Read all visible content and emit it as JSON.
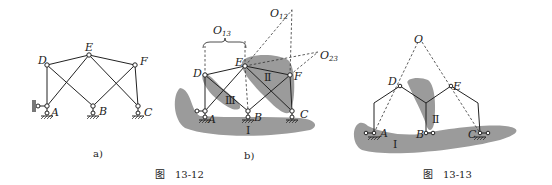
{
  "figure_13_12": {
    "caption": "图　13-12",
    "subfig_a": {
      "label": "a)",
      "joints": {
        "A": "A",
        "B": "B",
        "C": "C",
        "D": "D",
        "E": "E",
        "F": "F"
      }
    },
    "subfig_b": {
      "label": "b)",
      "joints": {
        "A": "A",
        "B": "B",
        "C": "C",
        "D": "D",
        "E": "E",
        "F": "F"
      },
      "instant_centers": {
        "O13": "O",
        "O13_sub": "13",
        "O12": "O",
        "O12_sub": "12",
        "O23": "O",
        "O23_sub": "23"
      },
      "rigid_bodies": {
        "I": "Ⅰ",
        "II": "Ⅱ",
        "III": "Ⅲ"
      }
    }
  },
  "figure_13_13": {
    "caption": "图　13-13",
    "joints": {
      "A": "A",
      "B": "B",
      "C": "C",
      "D": "D",
      "E": "E",
      "O": "O"
    },
    "rigid_bodies": {
      "I": "Ⅰ",
      "II": "Ⅱ"
    }
  },
  "colors": {
    "shade": "#9b9b9b",
    "line": "#222222",
    "background": "#ffffff"
  }
}
